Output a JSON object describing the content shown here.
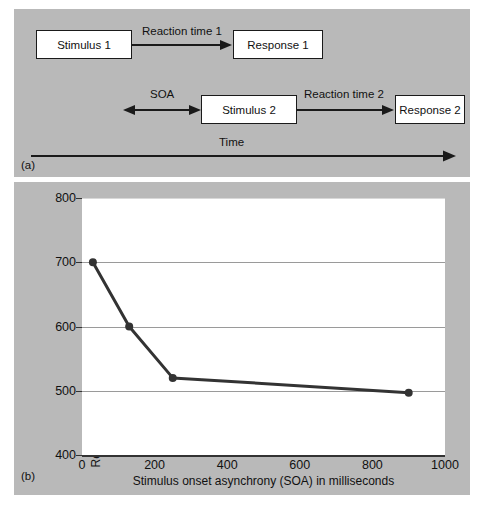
{
  "figure": {
    "panel_a_tag": "(a)",
    "panel_b_tag": "(b)",
    "background_color": "#b9b9b9",
    "plot_background_color": "#ffffff",
    "line_color": "#333333"
  },
  "diagram": {
    "boxes": [
      {
        "id": "stimulus-1",
        "label": "Stimulus 1"
      },
      {
        "id": "response-1",
        "label": "Response 1"
      },
      {
        "id": "stimulus-2",
        "label": "Stimulus 2"
      },
      {
        "id": "response-2",
        "label": "Response 2"
      }
    ],
    "arrow_labels": [
      {
        "id": "reaction-time-1",
        "label": "Reaction time 1"
      },
      {
        "id": "soa",
        "label": "SOA"
      },
      {
        "id": "reaction-time-2",
        "label": "Reaction time 2"
      },
      {
        "id": "time",
        "label": "Time"
      }
    ]
  },
  "chart_data": {
    "type": "line",
    "title": "",
    "xlabel": "Stimulus onset asynchrony (SOA) in milliseconds",
    "ylabel": "Reaction time for second stimulus (milliseconds)",
    "xlim": [
      0,
      1000
    ],
    "ylim": [
      400,
      800
    ],
    "xticks": [
      0,
      200,
      400,
      600,
      800,
      1000
    ],
    "yticks": [
      400,
      500,
      600,
      700,
      800
    ],
    "xtick_labels": [
      "0",
      "200",
      "400",
      "600",
      "800",
      "1000"
    ],
    "ytick_labels": [
      "400",
      "500",
      "600",
      "700",
      "800"
    ],
    "grid": true,
    "grid_axis": "y",
    "legend": null,
    "markers": "circle",
    "x": [
      30,
      130,
      250,
      900
    ],
    "values": [
      700,
      600,
      520,
      497
    ],
    "series": [
      {
        "name": "Reaction time for second stimulus",
        "x": [
          30,
          130,
          250,
          900
        ],
        "values": [
          700,
          600,
          520,
          497
        ]
      }
    ]
  }
}
